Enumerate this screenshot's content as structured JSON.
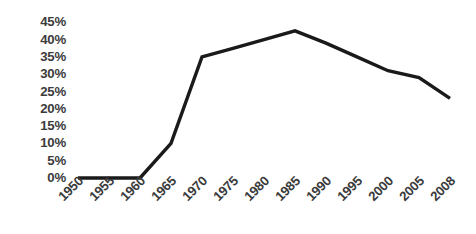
{
  "chart_data": {
    "type": "line",
    "title": "",
    "subtitle": "",
    "xlabel": "",
    "ylabel": "",
    "categories": [
      "1950",
      "1955",
      "1960",
      "1965",
      "1970",
      "1975",
      "1980",
      "1985",
      "1990",
      "1995",
      "2000",
      "2005",
      "2008"
    ],
    "values": [
      0,
      0,
      0,
      10,
      35,
      37.5,
      40,
      42.5,
      39,
      35,
      31,
      29,
      23
    ],
    "series": [
      {
        "name": "",
        "values": [
          0,
          0,
          0,
          10,
          35,
          37.5,
          40,
          42.5,
          39,
          35,
          31,
          29,
          23
        ]
      }
    ],
    "y_tick_labels": [
      "45%",
      "40%",
      "35%",
      "30%",
      "25%",
      "20%",
      "15%",
      "10%",
      "5%",
      "0%"
    ],
    "y_tick_values": [
      45,
      40,
      35,
      30,
      25,
      20,
      15,
      10,
      5,
      0
    ],
    "ylim": [
      0,
      45
    ],
    "y_unit": "%",
    "grid": false,
    "legend": "none",
    "line_color": "#1a1a1a",
    "text_color": "#3b3b3b",
    "background_color": "#ffffff",
    "x_tick_rotation": -45
  }
}
